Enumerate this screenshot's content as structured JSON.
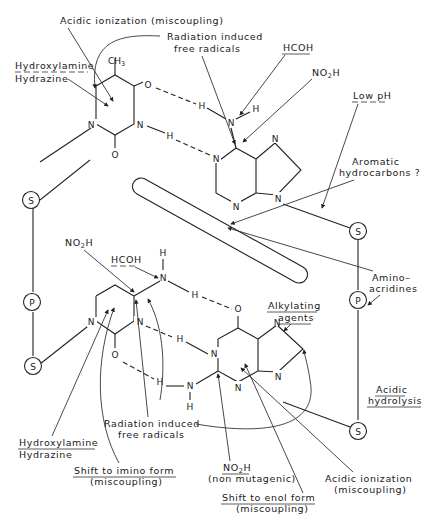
{
  "figure": {
    "colors": {
      "ink": "#1a1a1a",
      "background": "#ffffff"
    }
  },
  "backbone": {
    "left": {
      "top_sugar": "S",
      "phosphate": "P",
      "bottom_sugar": "S"
    },
    "right": {
      "top_sugar": "S",
      "phosphate": "P",
      "bottom_sugar": "S"
    }
  },
  "top_pair": {
    "pyrimidine": {
      "methyl": "CH3",
      "methyl_main": "CH",
      "methyl_sub": "3",
      "o_upper": "O",
      "o_lower": "O",
      "n1": "N",
      "n3": "N"
    },
    "purine": {
      "amino_n": "N",
      "h_left": "H",
      "h_right": "H",
      "n_ring1": "N",
      "n_ring_b1": "N",
      "n_ring_b2": "N",
      "n_imid_top": "N",
      "h_bond_mid": "H"
    }
  },
  "bottom_pair": {
    "pyrimidine": {
      "amino_n": "N",
      "h_top": "H",
      "h_bond": "H",
      "n1": "N",
      "n3": "N",
      "o": "O",
      "h_bond_mid": "H"
    },
    "purine": {
      "o": "O",
      "n1": "N",
      "n3": "N",
      "n_amino": "N",
      "h_amino": "H",
      "h_bond_low": "H",
      "n_imid_top": "N",
      "n_imid_bot": "N"
    }
  },
  "labels": {
    "acidic_ionization_top": "Acidic ionization (miscoupling)",
    "radiation_top_1": "Radiation induced",
    "radiation_top_2": "free radicals",
    "hcoh_top": "HCOH",
    "no2h_top_main": "NO",
    "no2h_top_sub": "2",
    "no2h_top_tail": "H",
    "hydroxylamine_top": "Hydroxylamine",
    "hydrazine_top": "Hydrazine",
    "low_ph": "Low pH",
    "aromatic_1": "Aromatic",
    "aromatic_2": "hydrocarbons ?",
    "no2h_mid_main": "NO",
    "no2h_mid_sub": "2",
    "no2h_mid_tail": "H",
    "hcoh_mid": "HCOH",
    "amino_acridines_1": "Amino–",
    "amino_acridines_2": "acridines",
    "alkylating_1": "Alkylating",
    "alkylating_2": "agents",
    "acidic_hydrolysis_1": "Acidic",
    "acidic_hydrolysis_2": "hydrolysis",
    "radiation_bot_1": "Radiation induced",
    "radiation_bot_2": "free radicals",
    "hydroxylamine_bot": "Hydroxylamine",
    "hydrazine_bot": "Hydrazine",
    "shift_imino_1": "Shift to imino form",
    "shift_imino_2": "(miscoupling)",
    "no2h_bot_main": "NO",
    "no2h_bot_sub": "2",
    "no2h_bot_tail": "H",
    "non_mutagenic": "(non mutagenic)",
    "shift_enol_1": "Shift to enol form",
    "shift_enol_2": "(miscoupling)",
    "acidic_ionization_bot_1": "Acidic ionization",
    "acidic_ionization_bot_2": "(miscoupling)"
  }
}
